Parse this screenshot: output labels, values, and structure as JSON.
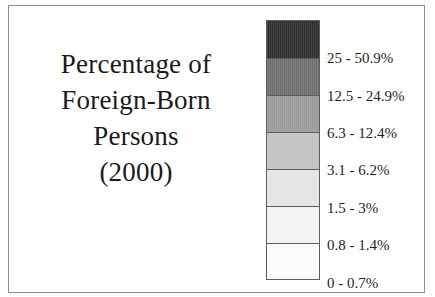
{
  "figure": {
    "kind": "map-legend",
    "background_color": "#ffffff",
    "frame_color": "#8d8d8d",
    "text_color": "#1a1a1a"
  },
  "title": {
    "lines": [
      "Percentage of",
      "Foreign-Born",
      "Persons",
      "(2000)"
    ]
  },
  "chart_data": {
    "type": "legend",
    "title": "Percentage of Foreign-Born Persons (2000)",
    "xlabel": "",
    "ylabel": "",
    "orientation": "vertical",
    "legend_position": "right",
    "grid": false,
    "categories": [
      "25 - 50.9%",
      "12.5 - 24.9%",
      "6.3 - 12.4%",
      "3.1 - 6.2%",
      "1.5 - 3%",
      "0.8 - 1.4%",
      "0 - 0.7%"
    ],
    "values": [
      50.9,
      24.9,
      12.4,
      6.2,
      3.0,
      1.4,
      0.7
    ],
    "colors": [
      "#2e2e2e",
      "#6e6e6e",
      "#9a9a9a",
      "#c2c2c2",
      "#e4e4e4",
      "#f2f2f2",
      "#fbfbfb"
    ],
    "classes": [
      {
        "label": "25 - 50.9%",
        "color": "#2e2e2e",
        "min": 25,
        "max": 50.9,
        "band_height": 38,
        "label_top": 30
      },
      {
        "label": "12.5 - 24.9%",
        "color": "#6e6e6e",
        "min": 12.5,
        "max": 24.9,
        "band_height": 37,
        "label_top": 68
      },
      {
        "label": "6.3 - 12.4%",
        "color": "#9a9a9a",
        "min": 6.3,
        "max": 12.4,
        "band_height": 37,
        "label_top": 105
      },
      {
        "label": "3.1 - 6.2%",
        "color": "#c2c2c2",
        "min": 3.1,
        "max": 6.2,
        "band_height": 37,
        "label_top": 142
      },
      {
        "label": "1.5 - 3%",
        "color": "#e4e4e4",
        "min": 1.5,
        "max": 3.0,
        "band_height": 37,
        "label_top": 180
      },
      {
        "label": "0.8 - 1.4%",
        "color": "#f2f2f2",
        "min": 0.8,
        "max": 1.4,
        "band_height": 37,
        "label_top": 217
      },
      {
        "label": "0 - 0.7%",
        "color": "#fbfbfb",
        "min": 0,
        "max": 0.7,
        "band_height": 35,
        "label_top": 255
      }
    ]
  }
}
